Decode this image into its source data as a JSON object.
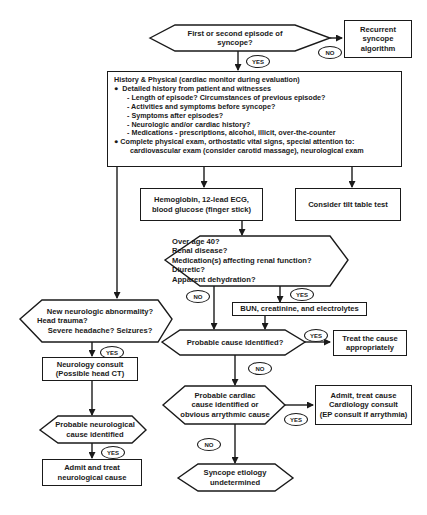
{
  "diagram": {
    "type": "flowchart",
    "topic": "Syncope evaluation algorithm",
    "nodes": {
      "start": {
        "text": "First or second episode of syncope?"
      },
      "recurrent": {
        "lines": [
          "Recurrent",
          "syncope",
          "algorithm"
        ]
      },
      "history": {
        "title": "History & Physical (cardiac monitor during evaluation)",
        "bullet1": "Detailed history from patient and witnesses",
        "sub": [
          "- Length of episode? Circumstances of previous episode?",
          "- Activities and symptoms before syncope?",
          "- Symptoms after episodes?",
          "- Neurologic and/or cardiac history?",
          "- Medications -  prescriptions, alcohol, illicit, over-the-counter"
        ],
        "bullet2": "Complete physical exam, orthostatic vital signs, special attention to:",
        "bullet2_cont": "cardiovascular exam (consider carotid massage), neurological exam"
      },
      "labs": {
        "lines": [
          "Hemoglobin, 12-lead ECG,",
          "blood glucose (finger stick)"
        ]
      },
      "tilt": {
        "text": "Consider tilt table test"
      },
      "renal": {
        "lines": [
          "Over age 40?",
          "Renal disease?",
          "Medication(s) affecting renal function?",
          "Diuretic?",
          "Apparent dehydration?"
        ]
      },
      "bun": {
        "text": "BUN, creatinine, and electrolytes"
      },
      "neuro_q": {
        "lines": [
          "New neurologic abnormality?",
          "Head trauma?",
          "Severe headache? Seizures?"
        ]
      },
      "probable": {
        "text": "Probable cause identified?"
      },
      "treat": {
        "lines": [
          "Treat the cause",
          "appropriately"
        ]
      },
      "neuro_consult": {
        "lines": [
          "Neurology consult",
          "(Possible head CT)"
        ]
      },
      "cardiac_q": {
        "lines": [
          "Probable cardiac",
          "cause identified or",
          "obvious arrythmic cause"
        ]
      },
      "admit_cardiac": {
        "lines": [
          "Admit, treat cause",
          "Cardiology consult",
          "(EP consult if arrythmia)"
        ]
      },
      "neuro_cause": {
        "lines": [
          "Probable neurological",
          "cause identified"
        ]
      },
      "admit_neuro": {
        "lines": [
          "Admit and treat",
          "neurological cause"
        ]
      },
      "undetermined": {
        "lines": [
          "Syncope etiology",
          "undetermined"
        ]
      }
    },
    "labels": {
      "yes": "YES",
      "no": "NO"
    }
  }
}
